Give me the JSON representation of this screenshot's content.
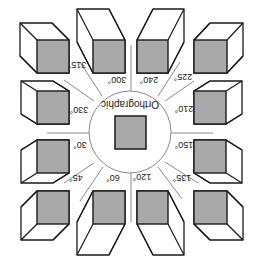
{
  "figure": {
    "title": "Orthographic",
    "rotation_deg": 180,
    "colors": {
      "face_fill": "#a9a9a9",
      "stroke": "#1a1a1a",
      "line": "#8a8a8a",
      "background": "#ffffff"
    },
    "center": {
      "cx": 130,
      "cy": 132,
      "r": 41
    },
    "center_square": {
      "x": 115,
      "y": 116,
      "w": 31,
      "h": 33
    },
    "views": [
      {
        "angle": "315°",
        "front": [
          37,
          40,
          32,
          33
        ],
        "offset": [
          -17,
          -17
        ],
        "label_pos": [
          77,
          68
        ]
      },
      {
        "angle": "300°",
        "front": [
          93,
          40,
          32,
          33
        ],
        "offset": [
          -16,
          -31
        ],
        "label_pos": [
          117,
          83
        ]
      },
      {
        "angle": "240°",
        "front": [
          137,
          40,
          31,
          33
        ],
        "offset": [
          16,
          -31
        ],
        "label_pos": [
          149,
          83
        ]
      },
      {
        "angle": "225°",
        "front": [
          194,
          40,
          33,
          33
        ],
        "offset": [
          16,
          -17
        ],
        "label_pos": [
          183,
          80
        ]
      },
      {
        "angle": "210°",
        "front": [
          194,
          91,
          32,
          33
        ],
        "offset": [
          16,
          -10
        ],
        "label_pos": [
          184,
          112
        ]
      },
      {
        "angle": "150°",
        "front": [
          194,
          140,
          32,
          33
        ],
        "offset": [
          16,
          10
        ],
        "label_pos": [
          184,
          148
        ]
      },
      {
        "angle": "135°",
        "front": [
          194,
          191,
          33,
          33
        ],
        "offset": [
          16,
          16
        ],
        "label_pos": [
          182,
          181
        ]
      },
      {
        "angle": "120°",
        "front": [
          137,
          191,
          31,
          33
        ],
        "offset": [
          16,
          31
        ],
        "label_pos": [
          142,
          180
        ]
      },
      {
        "angle": "60°",
        "front": [
          93,
          191,
          32,
          33
        ],
        "offset": [
          -16,
          31
        ],
        "label_pos": [
          113,
          181
        ]
      },
      {
        "angle": "45°",
        "front": [
          37,
          191,
          32,
          33
        ],
        "offset": [
          -16,
          16
        ],
        "label_pos": [
          76,
          181
        ]
      },
      {
        "angle": "30°",
        "front": [
          37,
          140,
          32,
          33
        ],
        "offset": [
          -16,
          10
        ],
        "label_pos": [
          80,
          148
        ]
      },
      {
        "angle": "330°",
        "front": [
          37,
          91,
          32,
          33
        ],
        "offset": [
          -16,
          -10
        ],
        "label_pos": [
          79,
          113
        ]
      }
    ],
    "spokes": [
      {
        "x1": 131,
        "y1": 45,
        "x2": 131,
        "y2": 91
      },
      {
        "x1": 131,
        "y1": 173,
        "x2": 131,
        "y2": 222
      },
      {
        "x1": 47,
        "y1": 133,
        "x2": 89,
        "y2": 133
      },
      {
        "x1": 171,
        "y1": 133,
        "x2": 213,
        "y2": 133
      },
      {
        "x1": 80,
        "y1": 62,
        "x2": 102,
        "y2": 96
      },
      {
        "x1": 64,
        "y1": 80,
        "x2": 94,
        "y2": 101
      },
      {
        "x1": 180,
        "y1": 62,
        "x2": 158,
        "y2": 96
      },
      {
        "x1": 194,
        "y1": 81,
        "x2": 165,
        "y2": 101
      },
      {
        "x1": 80,
        "y1": 201,
        "x2": 103,
        "y2": 167
      },
      {
        "x1": 64,
        "y1": 183,
        "x2": 94,
        "y2": 163
      },
      {
        "x1": 182,
        "y1": 199,
        "x2": 158,
        "y2": 167
      },
      {
        "x1": 198,
        "y1": 183,
        "x2": 165,
        "y2": 162
      }
    ]
  }
}
